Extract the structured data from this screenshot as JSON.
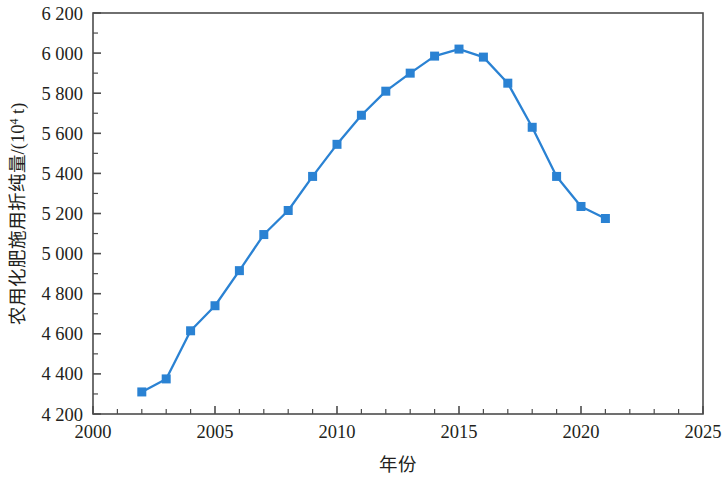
{
  "chart_data": {
    "type": "line",
    "title": "",
    "xlabel": "年份",
    "ylabel": "农用化肥施用折纯量/(10⁴ t)",
    "ylabel_base": "农用化肥施用折纯量/(10",
    "ylabel_sup": "4",
    "ylabel_tail": " t)",
    "xlim": [
      2000,
      2025
    ],
    "ylim": [
      4200,
      6200
    ],
    "xtick_major_step": 5,
    "xtick_minor_step": 1,
    "ytick_major_step": 200,
    "ytick_minor_step": 100,
    "grid": false,
    "legend": "none",
    "series_color": "#2a82d3",
    "marker": "square",
    "x": [
      2002,
      2003,
      2004,
      2005,
      2006,
      2007,
      2008,
      2009,
      2010,
      2011,
      2012,
      2013,
      2014,
      2015,
      2016,
      2017,
      2018,
      2019,
      2020,
      2021
    ],
    "values": [
      4310,
      4375,
      4615,
      4740,
      4915,
      5095,
      5215,
      5385,
      5545,
      5690,
      5810,
      5900,
      5985,
      6020,
      5980,
      5850,
      5630,
      5385,
      5235,
      5175
    ],
    "series": [
      {
        "name": "农用化肥施用折纯量",
        "values": [
          4310,
          4375,
          4615,
          4740,
          4915,
          5095,
          5215,
          5385,
          5545,
          5690,
          5810,
          5900,
          5985,
          6020,
          5980,
          5850,
          5630,
          5385,
          5235,
          5175
        ]
      }
    ],
    "xtick_labels": [
      "2000",
      "2005",
      "2010",
      "2015",
      "2020",
      "2025"
    ],
    "xtick_values": [
      2000,
      2005,
      2010,
      2015,
      2020,
      2025
    ],
    "ytick_labels": [
      "4 200",
      "4 400",
      "4 600",
      "4 800",
      "5 000",
      "5 200",
      "5 400",
      "5 600",
      "5 800",
      "6 000",
      "6 200"
    ],
    "ytick_values": [
      4200,
      4400,
      4600,
      4800,
      5000,
      5200,
      5400,
      5600,
      5800,
      6000,
      6200
    ]
  }
}
